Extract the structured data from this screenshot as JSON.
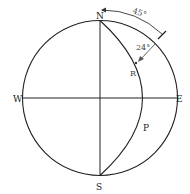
{
  "diagram": {
    "type": "stereonet-projection",
    "labels": {
      "north": "N",
      "south": "S",
      "east": "E",
      "west": "W",
      "plane": "P",
      "point": "R"
    },
    "annotations": {
      "strike_angle": "45°",
      "pitch_angle": "24°"
    },
    "colors": {
      "line": "#222222",
      "arrow": "#555555",
      "background": "#ffffff"
    }
  }
}
